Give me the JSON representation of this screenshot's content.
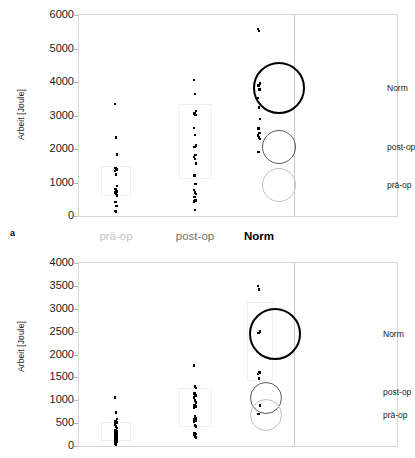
{
  "figure": {
    "panel_labels": [
      "a",
      ""
    ],
    "axis_title": "Arbeit [Joule]"
  },
  "colors": {
    "norm": "#000000",
    "post_op": "#595959",
    "pra_op": "#bfbfbf",
    "frame": "#d6d6d6",
    "tick": "#b7b7b7",
    "text": "#1a1a1a"
  },
  "chart_data": [
    {
      "type": "scatter",
      "title": "",
      "panel": "a",
      "xlabel": "",
      "ylabel": "Arbeit [Joule]",
      "ylim": [
        0,
        6000
      ],
      "yticks": [
        0,
        1000,
        2000,
        3000,
        4000,
        5000,
        6000
      ],
      "ytick_labels": [
        "0",
        "1000",
        "2000",
        "3000",
        "4000",
        "5000",
        "6000"
      ],
      "grid": false,
      "legend_position": "right-inside",
      "categories": [
        "prä-op",
        "post-op",
        "Norm"
      ],
      "series": [
        {
          "name": "prä-op",
          "color": "#bfbfbf",
          "values": [
            3340,
            2350,
            1840,
            1430,
            1390,
            1340,
            1230,
            900,
            800,
            740,
            700,
            660,
            620,
            420,
            300,
            150,
            130
          ]
        },
        {
          "name": "post-op",
          "color": "#595959",
          "values": [
            4060,
            3640,
            3130,
            3060,
            3010,
            2630,
            2420,
            2100,
            2060,
            1820,
            1760,
            1700,
            1560,
            1210,
            960,
            780,
            710,
            660,
            570,
            470,
            440,
            180
          ]
        },
        {
          "name": "Norm",
          "color": "#000000",
          "values": [
            5580,
            5520,
            3960,
            3890,
            3780,
            3520,
            3230,
            2900,
            2620,
            2480,
            2400,
            2350,
            2300,
            1910
          ]
        }
      ],
      "legend": [
        {
          "label": "Norm",
          "color": "#000000",
          "radius": 26,
          "stroke": 2.2
        },
        {
          "label": "post-op",
          "color": "#595959",
          "radius": 17,
          "stroke": 1.4
        },
        {
          "label": "prä-op",
          "color": "#bfbfbf",
          "radius": 17,
          "stroke": 1.4
        }
      ]
    },
    {
      "type": "scatter",
      "title": "",
      "panel": "b",
      "xlabel": "",
      "ylabel": "Arbeit [Joule]",
      "ylim": [
        0,
        4000
      ],
      "yticks": [
        0,
        500,
        1000,
        1500,
        2000,
        2500,
        3000,
        3500,
        4000
      ],
      "ytick_labels": [
        "0",
        "500",
        "1000",
        "1500",
        "2000",
        "2500",
        "3000",
        "3500",
        "4000"
      ],
      "grid": false,
      "legend_position": "right-inside",
      "categories": [
        "prä-op",
        "post-op",
        "Norm"
      ],
      "series": [
        {
          "name": "prä-op",
          "color": "#bfbfbf",
          "values": [
            1060,
            730,
            590,
            540,
            510,
            470,
            430,
            390,
            350,
            320,
            300,
            280,
            250,
            230,
            210,
            190,
            160,
            140,
            120,
            90,
            60,
            30
          ]
        },
        {
          "name": "post-op",
          "color": "#595959",
          "values": [
            1760,
            1300,
            1270,
            1150,
            1100,
            1060,
            1000,
            950,
            880,
            860,
            830,
            640,
            610,
            580,
            560,
            540,
            450,
            430,
            280,
            260,
            240,
            210,
            190
          ]
        },
        {
          "name": "Norm",
          "color": "#000000",
          "values": [
            3500,
            3420,
            2500,
            2470,
            1610,
            1570,
            1480,
            880,
            700
          ]
        }
      ],
      "legend": [
        {
          "label": "Norm",
          "color": "#000000",
          "radius": 26,
          "stroke": 2.2
        },
        {
          "label": "post-op",
          "color": "#595959",
          "radius": 16,
          "stroke": 1.4
        },
        {
          "label": "prä-op",
          "color": "#bfbfbf",
          "radius": 16,
          "stroke": 1.4
        }
      ]
    }
  ]
}
